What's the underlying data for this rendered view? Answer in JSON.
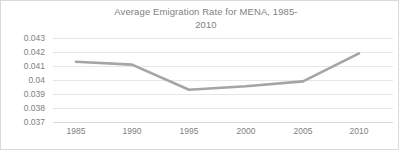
{
  "chart_data": {
    "type": "line",
    "title": "Average Emigration Rate for MENA, 1985-\n2010",
    "xlabel": "",
    "ylabel": "",
    "x": [
      1985,
      1990,
      1995,
      2000,
      2005,
      2010
    ],
    "categories": [
      "1985",
      "1990",
      "1995",
      "2000",
      "2005",
      "2010"
    ],
    "series": [
      {
        "name": "Average Emigration Rate",
        "values": [
          0.0413,
          0.0411,
          0.0393,
          0.03955,
          0.0399,
          0.0419
        ]
      }
    ],
    "ylim": [
      0.037,
      0.043
    ],
    "ytick_labels": [
      "0.043",
      "0.042",
      "0.041",
      "0.04",
      "0.039",
      "0.038",
      "0.037"
    ],
    "ytick_values": [
      0.043,
      0.042,
      0.041,
      0.04,
      0.039,
      0.038,
      0.037
    ],
    "xtick_labels": [
      "1985",
      "1990",
      "1995",
      "2000",
      "2005",
      "2010"
    ],
    "grid": "horizontal",
    "legend": "none",
    "colors": {
      "line": "#a5a5a5",
      "gridline": "#e6e6e6",
      "text": "#808080",
      "title_text": "#7f7f7f",
      "border": "#d9d9d9",
      "background": "#ffffff"
    }
  }
}
